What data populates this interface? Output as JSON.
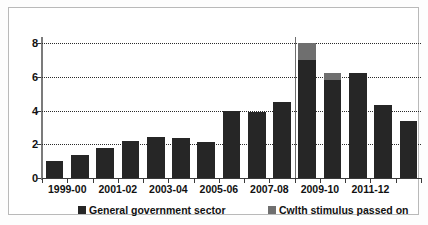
{
  "chart_data": {
    "type": "bar",
    "stacked": true,
    "title": "",
    "subtitle": "",
    "xlabel": "",
    "ylabel": "",
    "ylim": [
      0,
      8
    ],
    "yticks": [
      0,
      2,
      4,
      6,
      8
    ],
    "ytick_labels": [
      "0",
      "2",
      "4",
      "6",
      "8"
    ],
    "grid": "horizontal-dotted",
    "legend_position": "bottom",
    "categories": [
      "1999-00",
      "2000-01",
      "2001-02",
      "2002-03",
      "2003-04",
      "2004-05",
      "2005-06",
      "2006-07",
      "2007-08",
      "2008-09",
      "2009-10",
      "2010-11",
      "2011-12",
      "2012-13",
      "2013-14"
    ],
    "visible_tick_labels": [
      "1999-00",
      "2001-02",
      "2003-04",
      "2005-06",
      "2007-08",
      "2009-10",
      "2011-12"
    ],
    "visible_tick_label_indices": [
      0,
      2,
      4,
      6,
      8,
      10,
      12
    ],
    "series": [
      {
        "name": "General government sector",
        "color": "#262626",
        "values": [
          1.0,
          1.35,
          1.8,
          2.2,
          2.45,
          2.4,
          2.15,
          4.0,
          3.9,
          4.5,
          7.0,
          5.8,
          6.2,
          4.3,
          3.4
        ]
      },
      {
        "name": "Cwlth stimulus passed on",
        "color": "#6f6f6f",
        "values": [
          0,
          0,
          0,
          0,
          0,
          0,
          0,
          0,
          0,
          0,
          1.0,
          0.4,
          0,
          0,
          0
        ]
      }
    ],
    "totals": [
      1.0,
      1.35,
      1.8,
      2.2,
      2.45,
      2.4,
      2.15,
      4.0,
      3.9,
      4.5,
      8.0,
      6.2,
      6.2,
      4.3,
      3.4
    ],
    "annotations": [
      {
        "type": "vertical-divider",
        "after_category": "2008-09"
      }
    ]
  },
  "legend": {
    "items": [
      {
        "label": "General government sector",
        "color": "#262626"
      },
      {
        "label": "Cwlth stimulus passed on",
        "color": "#6f6f6f"
      }
    ]
  },
  "colors": {
    "main_series": "#262626",
    "stimulus_series": "#6f6f6f",
    "axis": "#3a3a3a",
    "grid": "#2b2b2b",
    "frame": "#b9b9b9",
    "background": "#ffffff"
  }
}
